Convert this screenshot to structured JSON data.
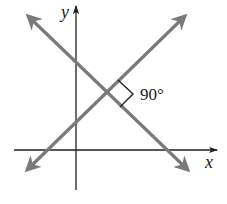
{
  "diagram": {
    "axes": {
      "x_label": "x",
      "y_label": "y",
      "color": "#1f1f1f"
    },
    "lines": [
      {
        "name": "line-positive-slope",
        "from": [
          25,
          172
        ],
        "to": [
          186,
          15
        ],
        "color": "#7a7a7a"
      },
      {
        "name": "line-negative-slope",
        "from": [
          27,
          15
        ],
        "to": [
          190,
          172
        ],
        "color": "#7a7a7a"
      }
    ],
    "intersection": [
      104,
      92
    ],
    "angle_label": "90°",
    "right_angle_marker_color": "#1f1f1f"
  }
}
